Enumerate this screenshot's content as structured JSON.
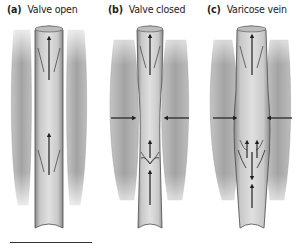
{
  "panels": [
    {
      "letter": "(a)",
      "title": "Valve open",
      "x": 7
    },
    {
      "letter": "(b)",
      "title": "Valve closed",
      "x": 108
    },
    {
      "letter": "(c)",
      "title": "Varicose vein",
      "x": 207
    }
  ],
  "colors": {
    "muscle": "#a9a9a9",
    "muscle_light": "#d2d2d2",
    "vein_wall": "#8c8c8c",
    "vein_lumen": "#d6d6d6",
    "outline": "#4a4a4a",
    "arrow": "#1e1e1e"
  },
  "arrows": {
    "a": [
      "up",
      "up"
    ],
    "b": [
      "right",
      "left",
      "up",
      "up"
    ],
    "c": [
      "right",
      "left",
      "up",
      "down",
      "up"
    ]
  }
}
